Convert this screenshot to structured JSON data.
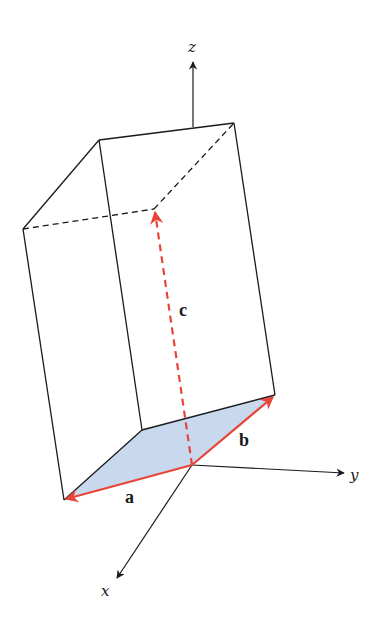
{
  "diagram": {
    "colors": {
      "edge": "#1a1a1a",
      "vector": "#e8443a",
      "base_fill": "#c8d9ee"
    },
    "axes": {
      "x": {
        "label": "x"
      },
      "y": {
        "label": "y"
      },
      "z": {
        "label": "z"
      }
    },
    "vectors": {
      "a": {
        "label": "a"
      },
      "b": {
        "label": "b"
      },
      "c": {
        "label": "c"
      }
    }
  }
}
